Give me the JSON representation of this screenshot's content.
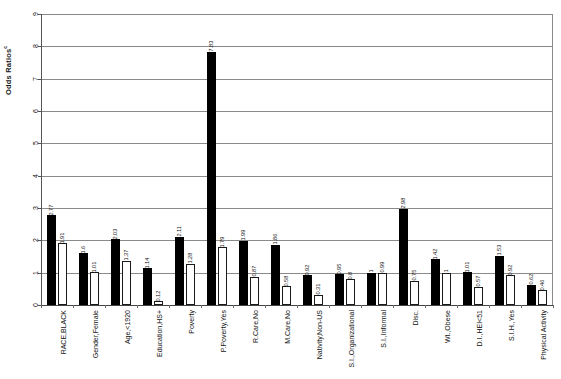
{
  "chart_data": {
    "type": "bar",
    "title": "",
    "xlabel": "",
    "ylabel": "Odds Ratios",
    "ylabel_superscript": "c",
    "ylim": [
      0,
      9
    ],
    "yticks": [
      0,
      1,
      2,
      3,
      4,
      5,
      6,
      7,
      8,
      9
    ],
    "grid": true,
    "legend": "none",
    "categories": [
      "RACE,BLACK",
      "Gender,Female",
      "Age,<1920",
      "Education,HS+",
      "Poverty",
      "P.Poverty,Yes",
      "R.Care,No",
      "M.Care,No",
      "Nativity,Non-US",
      "S.I.,Organizational",
      "S.I.,Informal",
      "Disc.",
      "Wt.,Obese",
      "D.I.,HEI<51",
      "S.I.H.,Yes",
      "Physical Activity"
    ],
    "series": [
      {
        "name": "solid",
        "color": "#000000",
        "values": [
          2.77,
          1.6,
          2.03,
          1.14,
          2.11,
          7.83,
          1.99,
          1.86,
          0.92,
          0.95,
          1.0,
          2.98,
          1.42,
          1.01,
          1.53,
          0.62
        ],
        "labels": [
          "2.77",
          "1.6",
          "2.03",
          "1.14",
          "2.11",
          "7.83",
          "1.99",
          "1.86",
          "0.92",
          "0.95",
          "1",
          "2.98",
          "1.42",
          "1.01",
          "1.53",
          "0.62"
        ]
      },
      {
        "name": "open",
        "color": "#ffffff",
        "values": [
          1.91,
          1.01,
          1.37,
          0.12,
          1.28,
          1.79,
          0.87,
          0.58,
          0.31,
          0.8,
          0.99,
          0.75,
          1.0,
          0.57,
          0.92,
          0.46
        ],
        "labels": [
          "1.91",
          "1.01",
          "1.37",
          "0.12",
          "1.28",
          "1.79",
          "0.87",
          "0.58",
          "0.31",
          "0.8",
          "0.99",
          "0.75",
          "1",
          "0.57",
          "0.92",
          "0.46"
        ]
      }
    ]
  }
}
